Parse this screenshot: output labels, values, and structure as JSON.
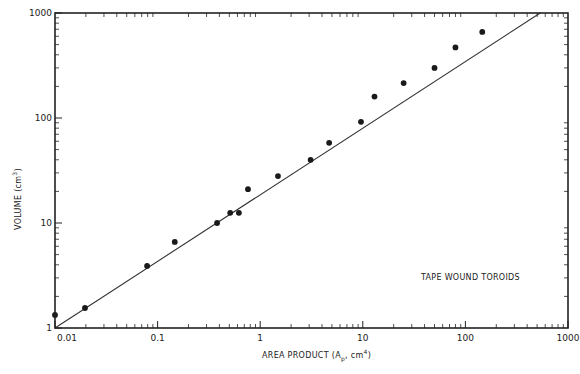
{
  "chart_data": {
    "type": "scatter",
    "title": "",
    "xlabel": "AREA PRODUCT (Ap, cm4)",
    "ylabel": "VOLUME (cm3)",
    "x_scale": "log",
    "y_scale": "log",
    "xlim": [
      0.01,
      1000
    ],
    "ylim": [
      1,
      1000
    ],
    "x_ticks": [
      0.01,
      0.1,
      1,
      10,
      100,
      1000
    ],
    "x_tick_labels": [
      "0.01",
      "0.1",
      "1",
      "10",
      "100",
      "1000"
    ],
    "y_ticks": [
      1,
      10,
      100,
      1000
    ],
    "y_tick_labels": [
      "1",
      "10",
      "100",
      "1000"
    ],
    "grid": false,
    "legend": null,
    "annotations": [
      {
        "text": "TAPE WOUND TOROIDS",
        "x": 45,
        "y": 3.6
      }
    ],
    "series": [
      {
        "name": "Tape wound toroids (data)",
        "kind": "scatter",
        "x": [
          0.01,
          0.0196,
          0.079,
          0.147,
          0.38,
          0.51,
          0.62,
          0.76,
          1.49,
          3.1,
          4.7,
          9.6,
          13,
          25,
          50,
          80,
          146
        ],
        "y": [
          1.33,
          1.55,
          3.9,
          6.6,
          10,
          12.5,
          12.5,
          21,
          28,
          40,
          58,
          92,
          160,
          215,
          300,
          470,
          660
        ]
      },
      {
        "name": "Fit line",
        "kind": "line",
        "x": [
          0.01,
          536
        ],
        "y": [
          1,
          1000
        ]
      }
    ]
  },
  "labels": {
    "xlabel_main": "AREA PRODUCT (A",
    "xlabel_sub": "p",
    "xlabel_mid": ", cm",
    "xlabel_sup": "4",
    "xlabel_end": ")",
    "ylabel_main": "VOLUME (cm",
    "ylabel_sup": "3",
    "ylabel_end": ")",
    "annotation": "TAPE WOUND TOROIDS"
  },
  "colors": {
    "axis": "#222222",
    "marker": "#1a1a1a",
    "line": "#333333",
    "background": "#ffffff"
  }
}
